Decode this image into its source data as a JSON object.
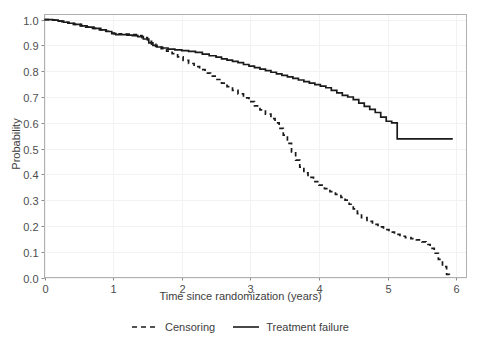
{
  "chart_data": {
    "type": "line",
    "title": "",
    "xlabel": "Time since randomization (years)",
    "ylabel": "Probability",
    "xlim": [
      0,
      6.15
    ],
    "ylim": [
      0,
      1.02
    ],
    "xticks": [
      "0",
      "1",
      "2",
      "3",
      "4",
      "5",
      "6"
    ],
    "xtick_values": [
      0,
      1,
      2,
      3,
      4,
      5,
      6
    ],
    "yticks": [
      "0.0",
      "0.1",
      "0.2",
      "0.3",
      "0.4",
      "0.5",
      "0.6",
      "0.7",
      "0.8",
      "0.9",
      "1.0"
    ],
    "ytick_values": [
      0.0,
      0.1,
      0.2,
      0.3,
      0.4,
      0.5,
      0.6,
      0.7,
      0.8,
      0.9,
      1.0
    ],
    "grid": true,
    "grid_color": "#f2f2f2",
    "panel_border_color": "#b0b0b0",
    "background": "#ffffff",
    "legend_position": "bottom",
    "step_type": "post",
    "series": [
      {
        "name": "Censoring",
        "style": "dashed",
        "color": "#1a1a1a",
        "points": [
          [
            0.0,
            1.0
          ],
          [
            0.1,
            0.998
          ],
          [
            0.18,
            0.994
          ],
          [
            0.26,
            0.99
          ],
          [
            0.34,
            0.986
          ],
          [
            0.42,
            0.982
          ],
          [
            0.52,
            0.976
          ],
          [
            0.6,
            0.971
          ],
          [
            0.7,
            0.966
          ],
          [
            0.8,
            0.96
          ],
          [
            0.88,
            0.955
          ],
          [
            0.96,
            0.948
          ],
          [
            1.02,
            0.944
          ],
          [
            1.1,
            0.945
          ],
          [
            1.18,
            0.944
          ],
          [
            1.26,
            0.942
          ],
          [
            1.34,
            0.938
          ],
          [
            1.42,
            0.93
          ],
          [
            1.5,
            0.916
          ],
          [
            1.56,
            0.905
          ],
          [
            1.62,
            0.896
          ],
          [
            1.7,
            0.888
          ],
          [
            1.78,
            0.878
          ],
          [
            1.86,
            0.868
          ],
          [
            1.94,
            0.856
          ],
          [
            2.02,
            0.842
          ],
          [
            2.1,
            0.83
          ],
          [
            2.18,
            0.818
          ],
          [
            2.26,
            0.806
          ],
          [
            2.34,
            0.793
          ],
          [
            2.42,
            0.781
          ],
          [
            2.5,
            0.768
          ],
          [
            2.58,
            0.754
          ],
          [
            2.66,
            0.74
          ],
          [
            2.74,
            0.726
          ],
          [
            2.82,
            0.712
          ],
          [
            2.9,
            0.697
          ],
          [
            2.98,
            0.682
          ],
          [
            3.06,
            0.666
          ],
          [
            3.14,
            0.65
          ],
          [
            3.22,
            0.634
          ],
          [
            3.3,
            0.616
          ],
          [
            3.36,
            0.6
          ],
          [
            3.42,
            0.578
          ],
          [
            3.48,
            0.552
          ],
          [
            3.54,
            0.52
          ],
          [
            3.6,
            0.487
          ],
          [
            3.66,
            0.455
          ],
          [
            3.72,
            0.428
          ],
          [
            3.78,
            0.406
          ],
          [
            3.84,
            0.388
          ],
          [
            3.92,
            0.372
          ],
          [
            4.0,
            0.358
          ],
          [
            4.08,
            0.345
          ],
          [
            4.16,
            0.333
          ],
          [
            4.24,
            0.322
          ],
          [
            4.32,
            0.311
          ],
          [
            4.38,
            0.3
          ],
          [
            4.44,
            0.284
          ],
          [
            4.5,
            0.266
          ],
          [
            4.56,
            0.248
          ],
          [
            4.62,
            0.232
          ],
          [
            4.7,
            0.218
          ],
          [
            4.78,
            0.206
          ],
          [
            4.86,
            0.196
          ],
          [
            4.94,
            0.186
          ],
          [
            5.02,
            0.176
          ],
          [
            5.1,
            0.167
          ],
          [
            5.18,
            0.16
          ],
          [
            5.26,
            0.155
          ],
          [
            5.34,
            0.151
          ],
          [
            5.42,
            0.146
          ],
          [
            5.5,
            0.138
          ],
          [
            5.56,
            0.128
          ],
          [
            5.62,
            0.113
          ],
          [
            5.68,
            0.094
          ],
          [
            5.74,
            0.07
          ],
          [
            5.8,
            0.042
          ],
          [
            5.86,
            0.012
          ],
          [
            5.9,
            0.002
          ]
        ]
      },
      {
        "name": "Treatment failure",
        "style": "solid",
        "color": "#1a1a1a",
        "points": [
          [
            0.0,
            1.0
          ],
          [
            0.12,
            0.998
          ],
          [
            0.2,
            0.994
          ],
          [
            0.28,
            0.99
          ],
          [
            0.36,
            0.986
          ],
          [
            0.44,
            0.982
          ],
          [
            0.54,
            0.976
          ],
          [
            0.62,
            0.971
          ],
          [
            0.72,
            0.966
          ],
          [
            0.82,
            0.96
          ],
          [
            0.9,
            0.954
          ],
          [
            0.98,
            0.946
          ],
          [
            1.04,
            0.942
          ],
          [
            1.12,
            0.942
          ],
          [
            1.2,
            0.94
          ],
          [
            1.28,
            0.938
          ],
          [
            1.36,
            0.934
          ],
          [
            1.44,
            0.925
          ],
          [
            1.52,
            0.91
          ],
          [
            1.58,
            0.9
          ],
          [
            1.64,
            0.894
          ],
          [
            1.72,
            0.89
          ],
          [
            1.8,
            0.886
          ],
          [
            1.9,
            0.883
          ],
          [
            2.0,
            0.88
          ],
          [
            2.1,
            0.877
          ],
          [
            2.2,
            0.873
          ],
          [
            2.3,
            0.866
          ],
          [
            2.4,
            0.86
          ],
          [
            2.5,
            0.855
          ],
          [
            2.58,
            0.848
          ],
          [
            2.66,
            0.843
          ],
          [
            2.74,
            0.838
          ],
          [
            2.82,
            0.833
          ],
          [
            2.9,
            0.826
          ],
          [
            2.98,
            0.82
          ],
          [
            3.06,
            0.814
          ],
          [
            3.14,
            0.808
          ],
          [
            3.22,
            0.802
          ],
          [
            3.3,
            0.796
          ],
          [
            3.38,
            0.79
          ],
          [
            3.46,
            0.784
          ],
          [
            3.54,
            0.778
          ],
          [
            3.62,
            0.772
          ],
          [
            3.7,
            0.766
          ],
          [
            3.78,
            0.76
          ],
          [
            3.86,
            0.754
          ],
          [
            3.94,
            0.748
          ],
          [
            4.02,
            0.742
          ],
          [
            4.1,
            0.736
          ],
          [
            4.18,
            0.726
          ],
          [
            4.26,
            0.716
          ],
          [
            4.34,
            0.706
          ],
          [
            4.42,
            0.7
          ],
          [
            4.5,
            0.69
          ],
          [
            4.58,
            0.676
          ],
          [
            4.66,
            0.664
          ],
          [
            4.74,
            0.652
          ],
          [
            4.82,
            0.64
          ],
          [
            4.9,
            0.622
          ],
          [
            4.98,
            0.606
          ],
          [
            5.06,
            0.6
          ],
          [
            5.14,
            0.538
          ],
          [
            5.4,
            0.538
          ],
          [
            5.7,
            0.538
          ],
          [
            5.95,
            0.538
          ]
        ]
      }
    ],
    "annotations": []
  },
  "legend": {
    "items": [
      {
        "label": "Censoring",
        "style": "dashed"
      },
      {
        "label": "Treatment failure",
        "style": "solid"
      }
    ]
  }
}
